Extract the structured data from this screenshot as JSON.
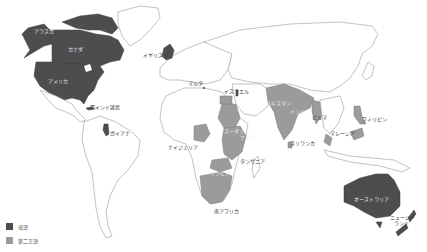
{
  "map": {
    "title": "",
    "colors": {
      "native": "#4d4d4f",
      "second": "#9b9b9d",
      "land": "#ffffff",
      "outline": "#9a9a9a"
    },
    "legend": [
      {
        "key": "native",
        "label": "母語"
      },
      {
        "key": "second",
        "label": "第二言語"
      }
    ],
    "regions": {
      "native": [
        "アラスカ",
        "カナダ",
        "アメリカ",
        "イギリス",
        "ガイアナ",
        "オーストラリア",
        "ニュージーランド"
      ],
      "second": [
        "インド",
        "パキスタン",
        "ナイジェリア",
        "スーダン",
        "ケニア",
        "タンザニア",
        "ザンビア",
        "南アフリカ",
        "フィリピン",
        "マレーシア",
        "ビルマ",
        "スリランカ"
      ]
    },
    "labels": {
      "alaska": "アラスカ",
      "canada": "カナダ",
      "usa": "アメリカ",
      "west_indies": "西インド諸島",
      "guyana": "ガイアナ",
      "uk": "イギリス",
      "malta": "マルタ",
      "israel": "イスラエル",
      "pakistan": "パキスタン",
      "india": "インド",
      "burma": "ビルマ",
      "sri_lanka": "スリランカ",
      "malaysia": "マレーシア",
      "philippines": "フィリピン",
      "nigeria": "ナイジェリア",
      "sudan": "スーダン",
      "kenya": "ケニア",
      "tanzania": "タンザニア",
      "zambia": "ザンビア",
      "south_africa": "南アフリカ",
      "australia": "オーストラリア",
      "new_zealand_1": "ニュージー",
      "new_zealand_2": "ランド"
    }
  }
}
